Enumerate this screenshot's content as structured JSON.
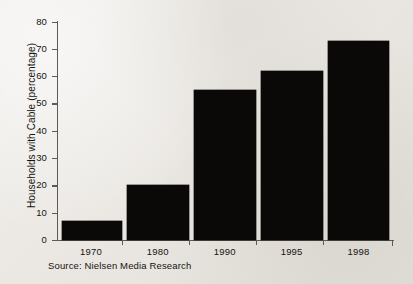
{
  "chart_data": {
    "type": "bar",
    "title": "",
    "subtitle": "",
    "categories": [
      "1970",
      "1980",
      "1990",
      "1995",
      "1998"
    ],
    "values": [
      7,
      20,
      55,
      62,
      73
    ],
    "xlabel": "",
    "ylabel": "Households with Cable (percentage)",
    "ylim": [
      0,
      80
    ],
    "ytick_labels": [
      "80",
      "70",
      "60",
      "50",
      "40",
      "30",
      "20",
      "10",
      "0"
    ],
    "ytick_values": [
      80,
      70,
      60,
      50,
      40,
      30,
      20,
      10,
      0
    ],
    "ytick_step": 10,
    "grid": false,
    "legend": null,
    "bar_color": "#0a0908",
    "axis_color": "#5d5a55",
    "background_color": "#eceae6",
    "annotations": [
      {
        "name": "source-note",
        "text": "Source: Nielsen Media Research"
      }
    ]
  }
}
